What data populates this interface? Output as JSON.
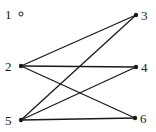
{
  "graph": {
    "type": "bipartite-graph",
    "nodes": [
      {
        "id": "1",
        "label": "1",
        "x": 21,
        "y": 14,
        "isolated": true
      },
      {
        "id": "2",
        "label": "2",
        "x": 21,
        "y": 66
      },
      {
        "id": "5",
        "label": "5",
        "x": 21,
        "y": 120
      },
      {
        "id": "3",
        "label": "3",
        "x": 136,
        "y": 15
      },
      {
        "id": "4",
        "label": "4",
        "x": 136,
        "y": 67
      },
      {
        "id": "6",
        "label": "6",
        "x": 135,
        "y": 118
      }
    ],
    "edges": [
      {
        "from": "2",
        "to": "3"
      },
      {
        "from": "2",
        "to": "4"
      },
      {
        "from": "2",
        "to": "6"
      },
      {
        "from": "5",
        "to": "3"
      },
      {
        "from": "5",
        "to": "4"
      },
      {
        "from": "5",
        "to": "6"
      }
    ],
    "colors": {
      "ink": "#1a1a1a",
      "background": "#ffffff"
    }
  }
}
